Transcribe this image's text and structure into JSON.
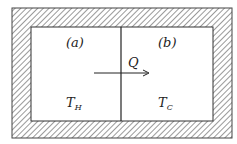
{
  "diagram": {
    "region_a_label": "(a)",
    "region_b_label": "(b)",
    "heat_flow_label": "Q",
    "temp_a": {
      "symbol": "T",
      "subscript": "H"
    },
    "temp_b": {
      "symbol": "T",
      "subscript": "C"
    },
    "colors": {
      "line": "#222222",
      "hatch": "#555555",
      "background": "#ffffff"
    }
  }
}
